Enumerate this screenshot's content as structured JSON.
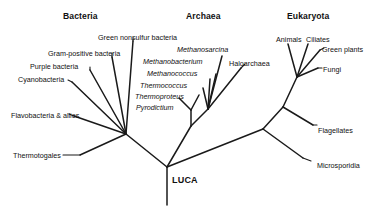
{
  "figure": {
    "type": "phylogenetic-tree",
    "root_label": "LUCA",
    "background_color": "#ffffff",
    "line_color": "#1a1a1a",
    "text_color": "#111111"
  },
  "domains": [
    {
      "id": "bacteria",
      "label": "Bacteria",
      "x": 63,
      "y": 12
    },
    {
      "id": "archaea",
      "label": "Archaea",
      "x": 186,
      "y": 12
    },
    {
      "id": "eukaryota",
      "label": "Eukaryota",
      "x": 287,
      "y": 12
    }
  ],
  "taxa": {
    "bacteria": [
      {
        "id": "green-nonsulfur-bacteria",
        "label": "Green nonsulfur bacteria",
        "italic": false,
        "x": 98,
        "y": 34
      },
      {
        "id": "gram-positive-bacteria",
        "label": "Gram-positive bacteria",
        "italic": false,
        "x": 48,
        "y": 50
      },
      {
        "id": "purple-bacteria",
        "label": "Purple bacteria",
        "italic": false,
        "x": 30,
        "y": 63
      },
      {
        "id": "cyanobacteria",
        "label": "Cyanobacteria",
        "italic": false,
        "x": 18,
        "y": 76
      },
      {
        "id": "flavobacteria-and-allies",
        "label": "Flavobacteria & allies",
        "italic": false,
        "x": 11,
        "y": 112
      },
      {
        "id": "thermotogales",
        "label": "Thermotogales",
        "italic": false,
        "x": 13,
        "y": 152
      }
    ],
    "archaea": [
      {
        "id": "methanosarcina",
        "label": "Methanosarcina",
        "italic": true,
        "x": 177,
        "y": 46
      },
      {
        "id": "methanobacterium",
        "label": "Methanobacterium",
        "italic": true,
        "x": 143,
        "y": 58
      },
      {
        "id": "haloarchaea",
        "label": "Haloarchaea",
        "italic": false,
        "x": 229,
        "y": 60
      },
      {
        "id": "methanococcus",
        "label": "Methanococcus",
        "italic": true,
        "x": 147,
        "y": 70
      },
      {
        "id": "thermococcus",
        "label": "Thermococcus",
        "italic": true,
        "x": 140,
        "y": 82
      },
      {
        "id": "thermoproteus",
        "label": "Thermoproteus",
        "italic": true,
        "x": 135,
        "y": 93
      },
      {
        "id": "pyrodictium",
        "label": "Pyrodictium",
        "italic": true,
        "x": 136,
        "y": 104
      }
    ],
    "eukaryota": [
      {
        "id": "animals",
        "label": "Animals",
        "italic": false,
        "x": 276,
        "y": 36
      },
      {
        "id": "ciliates",
        "label": "Ciliates",
        "italic": false,
        "x": 306,
        "y": 36
      },
      {
        "id": "green-plants",
        "label": "Green plants",
        "italic": false,
        "x": 322,
        "y": 46
      },
      {
        "id": "fungi",
        "label": "Fungi",
        "italic": false,
        "x": 323,
        "y": 66
      },
      {
        "id": "flagellates",
        "label": "Flagellates",
        "italic": false,
        "x": 318,
        "y": 127
      },
      {
        "id": "microsporidia",
        "label": "Microsporidia",
        "italic": false,
        "x": 317,
        "y": 162
      }
    ]
  },
  "root": {
    "label": "LUCA",
    "x": 172,
    "y": 176
  },
  "tree_structure": {
    "root_node": [
      167,
      167
    ],
    "bacteria_node": [
      126,
      134
    ],
    "archaea_node": [
      191,
      126
    ],
    "eukaryota_node": [
      263,
      129
    ],
    "notes": "Three backbone branches radiate from the root node; LUCA stem descends vertically below it."
  },
  "edges": [
    {
      "name": "stem-luca",
      "from": [
        167,
        167
      ],
      "to": [
        167,
        205
      ]
    },
    {
      "name": "backbone-bacteria",
      "from": [
        167,
        167
      ],
      "to": [
        126,
        134
      ]
    },
    {
      "name": "backbone-archaea",
      "from": [
        167,
        167
      ],
      "to": [
        191,
        126
      ]
    },
    {
      "name": "backbone-eukaryota",
      "from": [
        167,
        167
      ],
      "to": [
        263,
        129
      ]
    },
    {
      "name": "branch-thermotogales",
      "from": [
        126,
        134
      ],
      "to": [
        80,
        155
      ]
    },
    {
      "name": "branch-flavobacteria",
      "from": [
        126,
        134
      ],
      "to": [
        74,
        116
      ]
    },
    {
      "name": "branch-cyanobacteria",
      "from": [
        126,
        134
      ],
      "to": [
        72,
        82
      ]
    },
    {
      "name": "branch-purple-bacteria",
      "from": [
        126,
        134
      ],
      "to": [
        90,
        70
      ]
    },
    {
      "name": "branch-gram-positive",
      "from": [
        126,
        134
      ],
      "to": [
        112,
        57
      ]
    },
    {
      "name": "branch-green-nonsulfur",
      "from": [
        126,
        134
      ],
      "to": [
        133,
        41
      ]
    },
    {
      "name": "archaea-crenarchaeota-stem",
      "from": [
        191,
        126
      ],
      "to": [
        191,
        110
      ]
    },
    {
      "name": "branch-pyrodictium",
      "from": [
        191,
        110
      ],
      "to": [
        179,
        98
      ]
    },
    {
      "name": "branch-thermoproteus",
      "from": [
        191,
        110
      ],
      "to": [
        199,
        95
      ]
    },
    {
      "name": "archaea-euryarchaeota-stem",
      "from": [
        191,
        126
      ],
      "to": [
        208,
        109
      ]
    },
    {
      "name": "branch-thermococcus",
      "from": [
        208,
        109
      ],
      "to": [
        203,
        88
      ]
    },
    {
      "name": "branch-methanococcus",
      "from": [
        208,
        109
      ],
      "to": [
        210,
        79
      ]
    },
    {
      "name": "branch-methanobacterium",
      "from": [
        208,
        109
      ],
      "to": [
        216,
        74
      ]
    },
    {
      "name": "branch-methanosarcina",
      "from": [
        208,
        109
      ],
      "to": [
        222,
        56
      ]
    },
    {
      "name": "branch-haloarchaea",
      "from": [
        208,
        109
      ],
      "to": [
        241,
        68
      ]
    },
    {
      "name": "euk-deep-stem",
      "from": [
        263,
        129
      ],
      "to": [
        283,
        107
      ]
    },
    {
      "name": "branch-microsporidia",
      "from": [
        263,
        129
      ],
      "to": [
        303,
        158
      ]
    },
    {
      "name": "branch-flagellates",
      "from": [
        283,
        107
      ],
      "to": [
        313,
        125
      ]
    },
    {
      "name": "euk-crown-stem",
      "from": [
        283,
        107
      ],
      "to": [
        297,
        77
      ]
    },
    {
      "name": "branch-animals",
      "from": [
        297,
        77
      ],
      "to": [
        288,
        44
      ]
    },
    {
      "name": "branch-ciliates",
      "from": [
        297,
        77
      ],
      "to": [
        308,
        44
      ]
    },
    {
      "name": "branch-green-plants",
      "from": [
        297,
        77
      ],
      "to": [
        320,
        50
      ]
    },
    {
      "name": "branch-fungi",
      "from": [
        297,
        77
      ],
      "to": [
        318,
        68
      ]
    }
  ],
  "leaders": [
    {
      "name": "leader-green-nonsulfur",
      "from": [
        133,
        41
      ],
      "to": [
        133,
        38
      ]
    },
    {
      "name": "leader-gram-positive",
      "from": [
        112,
        57
      ],
      "to": [
        112,
        53
      ]
    },
    {
      "name": "leader-purple-bacteria",
      "from": [
        90,
        70
      ],
      "to": [
        90,
        67
      ]
    },
    {
      "name": "leader-cyanobacteria",
      "from": [
        72,
        82
      ],
      "to": [
        68,
        80
      ]
    },
    {
      "name": "leader-flavobacteria",
      "from": [
        74,
        116
      ],
      "to": [
        69,
        114
      ]
    },
    {
      "name": "leader-thermotogales",
      "from": [
        80,
        155
      ],
      "to": [
        63,
        155
      ]
    },
    {
      "name": "leader-haloarchaea",
      "from": [
        241,
        68
      ],
      "to": [
        245,
        64
      ]
    },
    {
      "name": "leader-green-plants",
      "from": [
        320,
        50
      ],
      "to": [
        324,
        48
      ]
    },
    {
      "name": "leader-fungi",
      "from": [
        318,
        68
      ],
      "to": [
        322,
        68
      ]
    },
    {
      "name": "leader-flagellates",
      "from": [
        313,
        125
      ],
      "to": [
        317,
        125
      ]
    },
    {
      "name": "leader-microsporidia",
      "from": [
        303,
        158
      ],
      "to": [
        311,
        161
      ]
    }
  ]
}
